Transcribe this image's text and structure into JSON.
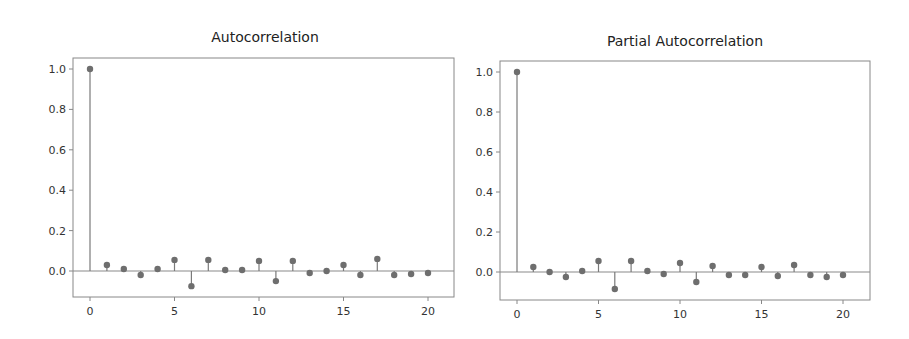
{
  "chart_data": [
    {
      "type": "stem",
      "title": "Autocorrelation",
      "xlabel": "",
      "ylabel": "",
      "x": [
        0,
        1,
        2,
        3,
        4,
        5,
        6,
        7,
        8,
        9,
        10,
        11,
        12,
        13,
        14,
        15,
        16,
        17,
        18,
        19,
        20
      ],
      "values": [
        1.0,
        0.03,
        0.01,
        -0.02,
        0.01,
        0.055,
        -0.075,
        0.055,
        0.005,
        0.005,
        0.05,
        -0.05,
        0.05,
        -0.01,
        0.0,
        0.03,
        -0.02,
        0.06,
        -0.02,
        -0.015,
        -0.01
      ],
      "xticks": [
        "0",
        "5",
        "10",
        "15",
        "20"
      ],
      "yticks": [
        "0.0",
        "0.2",
        "0.4",
        "0.6",
        "0.8",
        "1.0"
      ],
      "xlim": [
        -1,
        21.6
      ],
      "ylim": [
        -0.13,
        1.06
      ],
      "grid": false,
      "baseline": 0.0
    },
    {
      "type": "stem",
      "title": "Partial Autocorrelation",
      "xlabel": "",
      "ylabel": "",
      "x": [
        0,
        1,
        2,
        3,
        4,
        5,
        6,
        7,
        8,
        9,
        10,
        11,
        12,
        13,
        14,
        15,
        16,
        17,
        18,
        19,
        20
      ],
      "values": [
        1.0,
        0.025,
        0.0,
        -0.025,
        0.005,
        0.055,
        -0.085,
        0.055,
        0.005,
        -0.01,
        0.045,
        -0.05,
        0.03,
        -0.015,
        -0.015,
        0.025,
        -0.02,
        0.035,
        -0.015,
        -0.025,
        -0.015
      ],
      "xticks": [
        "0",
        "5",
        "10",
        "15",
        "20"
      ],
      "yticks": [
        "0.0",
        "0.2",
        "0.4",
        "0.6",
        "0.8",
        "1.0"
      ],
      "xlim": [
        -1,
        21.6
      ],
      "ylim": [
        -0.13,
        1.06
      ],
      "grid": false,
      "baseline": 0.0
    }
  ],
  "charts": [
    {
      "title": "Autocorrelation",
      "box": {
        "x0": 73,
        "y0": 58,
        "x1": 454,
        "y1": 297
      },
      "xmap": {
        "x0px": 90,
        "x20px": 428
      },
      "ymap": {
        "y0px": 271,
        "y1px": 69
      },
      "title_pos": {
        "x": 265,
        "y": 42
      }
    },
    {
      "title": "Partial Autocorrelation",
      "box": {
        "x0": 500,
        "y0": 61,
        "x1": 870,
        "y1": 300
      },
      "xmap": {
        "x0px": 517,
        "x20px": 843
      },
      "ymap": {
        "y0px": 272,
        "y1px": 72
      },
      "title_pos": {
        "x": 685,
        "y": 46
      }
    }
  ],
  "colors": {
    "stem": "#7a7a7a",
    "marker": "#6e6e6e",
    "axis": "#888888",
    "baseline": "#8a8a8a",
    "text": "#333333"
  }
}
